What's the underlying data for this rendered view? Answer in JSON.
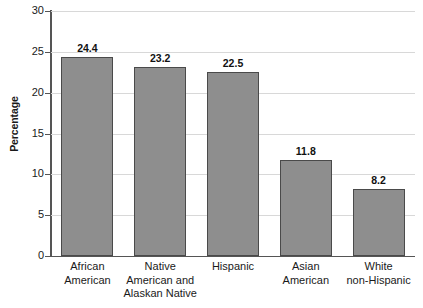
{
  "chart_data": {
    "type": "bar",
    "title": "",
    "xlabel": "",
    "ylabel": "Percentage",
    "ylim": [
      0,
      30
    ],
    "ytick_values": [
      30,
      25,
      20,
      15,
      10,
      5,
      0
    ],
    "ytick_labels": [
      "30",
      "25",
      "20",
      "15",
      "10",
      "5",
      "0"
    ],
    "grid": true,
    "legend": false,
    "categories": [
      "African American",
      "Native American and Alaskan Native",
      "Hispanic",
      "Asian American",
      "White non-Hispanic"
    ],
    "category_lines": [
      [
        "African",
        "American"
      ],
      [
        "Native",
        "American and",
        "Alaskan Native"
      ],
      [
        "Hispanic"
      ],
      [
        "Asian",
        "American"
      ],
      [
        "White",
        "non-Hispanic"
      ]
    ],
    "values": [
      24.4,
      23.2,
      22.5,
      11.8,
      8.2
    ],
    "value_labels": [
      "24.4",
      "23.2",
      "22.5",
      "11.8",
      "8.2"
    ],
    "colors": {
      "bar_fill": "#8e8e8e",
      "bar_edge": "#4a4a4a",
      "gridline": "#d8d8d8",
      "axis": "#555555",
      "text": "#1a1a1a",
      "background": "#ffffff"
    }
  }
}
